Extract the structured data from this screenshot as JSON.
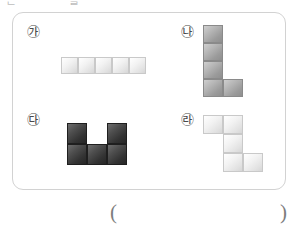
{
  "page": {
    "top_clipped_text": "ᆫ ᆞ ᆞ ᆯ ᆞ ᆞ ᆞ"
  },
  "panel": {
    "options": [
      {
        "id": "ga",
        "label": "㉮",
        "shade": "pale",
        "rows": 1,
        "cols": 5,
        "grid": [
          [
            1,
            1,
            1,
            1,
            1
          ]
        ]
      },
      {
        "id": "na",
        "label": "㉯",
        "shade": "mid",
        "rows": 4,
        "cols": 2,
        "grid": [
          [
            1,
            0
          ],
          [
            1,
            0
          ],
          [
            1,
            0
          ],
          [
            1,
            1
          ]
        ]
      },
      {
        "id": "da",
        "label": "㉰",
        "shade": "dark",
        "rows": 2,
        "cols": 3,
        "grid": [
          [
            1,
            0,
            1
          ],
          [
            1,
            1,
            1
          ]
        ]
      },
      {
        "id": "ra",
        "label": "㉱",
        "shade": "pale",
        "rows": 3,
        "cols": 3,
        "grid": [
          [
            1,
            1,
            0
          ],
          [
            0,
            1,
            0
          ],
          [
            0,
            1,
            1
          ]
        ]
      }
    ]
  },
  "answer": {
    "open_paren": "(",
    "close_paren": ")",
    "value": ""
  },
  "colors": {
    "panel_border": "#d2d2d2",
    "cell_border": "#b9b9b9",
    "pale_cell": "#e8e8e8",
    "mid_cell": "#a6a6a6",
    "dark_cell": "#3a3a3a",
    "label_text": "#4a4a4a",
    "paren_text": "#7d7d7d"
  }
}
